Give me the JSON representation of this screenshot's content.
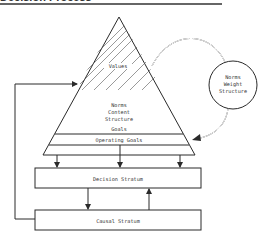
{
  "heading": "Decision Process",
  "diagram": {
    "triangle": {
      "top_region_label": "Values",
      "middle_label_lines": [
        "Norms",
        "Content",
        "Structure"
      ],
      "goals_label": "Goals",
      "base_band_label": "Operating Goals"
    },
    "circle": {
      "label_lines": [
        "Norms",
        "Weight",
        "Structure"
      ]
    },
    "boxes": [
      {
        "label": "Decision Stratum"
      },
      {
        "label": "Causal Stratum"
      }
    ],
    "connections": [
      {
        "from": "Norms Weight Structure",
        "to": "Values",
        "style": "double-line"
      },
      {
        "from": "Norms Weight Structure",
        "to": "Goals",
        "style": "double-line arrow"
      },
      {
        "from": "Operating Goals",
        "to": "Decision Stratum",
        "count": 3
      },
      {
        "from": "Decision Stratum",
        "to": "Causal Stratum"
      },
      {
        "from": "Causal Stratum",
        "to": "Decision Stratum"
      },
      {
        "from": "Causal Stratum",
        "to": "Norms Content Structure",
        "style": "feedback loop"
      }
    ]
  }
}
